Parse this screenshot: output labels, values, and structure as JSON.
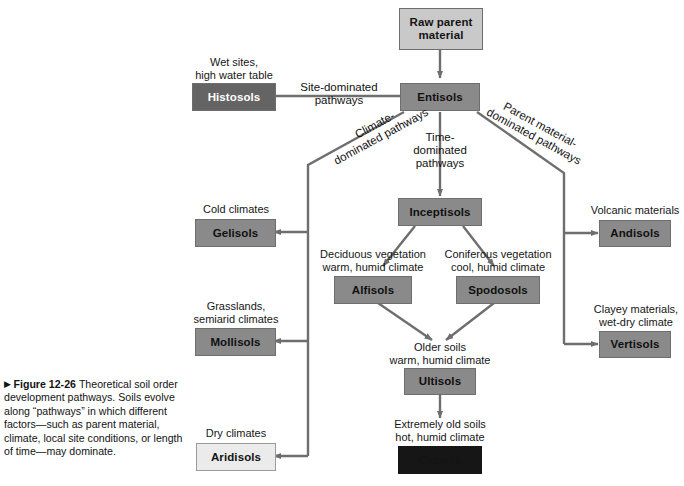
{
  "figure": {
    "marker": "▶",
    "number": "Figure 12-26",
    "caption": "Theoretical soil order development pathways. Soils evolve along “pathways” in which different factors—such as parent material, climate, local site conditions, or length of time—may dominate."
  },
  "nodes": {
    "raw_parent": {
      "label": "Raw parent\nmaterial",
      "shade": "light"
    },
    "entisols": {
      "label": "Entisols",
      "shade": "medium"
    },
    "histosols": {
      "label": "Histosols",
      "shade": "dark"
    },
    "inceptisols": {
      "label": "Inceptisols",
      "shade": "medium"
    },
    "gelisols": {
      "label": "Gelisols",
      "shade": "medium"
    },
    "andisols": {
      "label": "Andisols",
      "shade": "medium"
    },
    "alfisols": {
      "label": "Alfisols",
      "shade": "medium"
    },
    "spodosols": {
      "label": "Spodosols",
      "shade": "medium"
    },
    "mollisols": {
      "label": "Mollisols",
      "shade": "medium"
    },
    "vertisols": {
      "label": "Vertisols",
      "shade": "medium"
    },
    "ultisols": {
      "label": "Ultisols",
      "shade": "medium"
    },
    "aridisols": {
      "label": "Aridisols",
      "shade": "pale"
    },
    "oxisols": {
      "label": "Oxisols",
      "shade": "black"
    }
  },
  "condition_labels": {
    "histosols": "Wet sites,\nhigh water table",
    "gelisols": "Cold climates",
    "andisols": "Volcanic materials",
    "alfisols": "Deciduous vegetation\nwarm, humid climate",
    "spodosols": "Coniferous vegetation\ncool, humid climate",
    "mollisols": "Grasslands,\nsemiarid climates",
    "vertisols": "Clayey materials,\nwet-dry climate",
    "ultisols": "Older soils\nwarm, humid climate",
    "aridisols": "Dry climates",
    "oxisols": "Extremely old soils\nhot, humid climate"
  },
  "pathway_labels": {
    "site": "Site-dominated\npathways",
    "climate": "Climate-\ndominated pathways",
    "time": "Time-\ndominated\npathways",
    "parent": "Parent material-\ndominated pathways"
  },
  "colors": {
    "line": "#6e6e6e",
    "shade_light": "#c9c9c9",
    "shade_medium": "#8a8a8a",
    "shade_dark": "#646464",
    "shade_pale": "#ebebeb",
    "shade_black": "#161616",
    "background": "#ffffff"
  }
}
